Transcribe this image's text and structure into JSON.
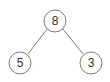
{
  "diagram": {
    "type": "binary-tree",
    "nodes": [
      {
        "id": "root",
        "label": "8",
        "cx": 55,
        "cy": 21,
        "r": 11
      },
      {
        "id": "left",
        "label": "5",
        "cx": 20,
        "cy": 63,
        "r": 11
      },
      {
        "id": "right",
        "label": "3",
        "cx": 91,
        "cy": 63,
        "r": 11
      }
    ],
    "edges": [
      {
        "from": "root",
        "to": "left"
      },
      {
        "from": "root",
        "to": "right"
      }
    ],
    "colors": {
      "stroke": "#7a7a7a",
      "text": "#333333",
      "background": "#ffffff"
    }
  }
}
